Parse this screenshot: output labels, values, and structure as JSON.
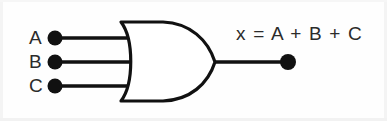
{
  "figure": {
    "type": "logic-gate-diagram",
    "gate_type": "OR",
    "background_color": "#fefefe",
    "line_color": "#111111",
    "text_color": "#2b2b2b"
  },
  "inputs": [
    {
      "label": "A",
      "y": 38
    },
    {
      "label": "B",
      "y": 62
    },
    {
      "label": "C",
      "y": 86
    }
  ],
  "output": {
    "expression": "x = A + B + C",
    "variable": "x",
    "operator": "+",
    "y": 62
  },
  "icons": {
    "input_terminal": "filled-dot",
    "output_terminal": "filled-dot",
    "gate": "or-gate-shape"
  }
}
